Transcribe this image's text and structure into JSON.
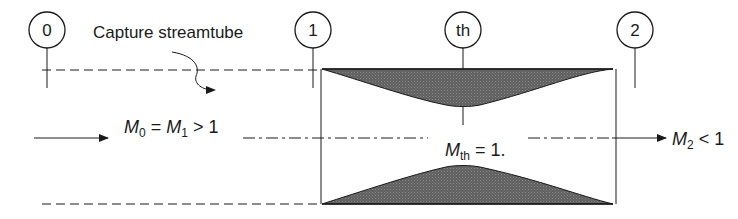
{
  "stations": [
    {
      "id": "station-0",
      "label": "0",
      "cx": 47,
      "cy": 30
    },
    {
      "id": "station-1",
      "label": "1",
      "cx": 313,
      "cy": 30
    },
    {
      "id": "station-th",
      "label": "th",
      "cx": 463,
      "cy": 30
    },
    {
      "id": "station-2",
      "label": "2",
      "cx": 635,
      "cy": 30
    }
  ],
  "annotations": {
    "capture_streamtube": "Capture streamtube",
    "inlet_condition": {
      "m": "M",
      "sub0": "0",
      "eq": " = ",
      "m1": "M",
      "sub1": "1",
      "rel": " > 1"
    },
    "throat_condition": {
      "m": "M",
      "sub": "th",
      "rel": " = 1."
    },
    "exit_condition": {
      "m": "M",
      "sub": "2",
      "rel": " < 1"
    }
  },
  "colors": {
    "line": "#1a1a1a",
    "fill": "#6b6b6b",
    "background": "#ffffff"
  }
}
